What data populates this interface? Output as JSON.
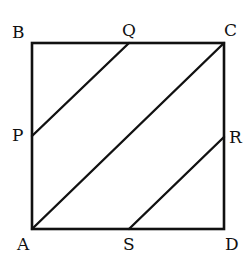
{
  "figure": {
    "points": {
      "A": "A",
      "B": "B",
      "C": "C",
      "D": "D",
      "P": "P",
      "Q": "Q",
      "R": "R",
      "S": "S"
    },
    "segments": [
      "AB",
      "BC",
      "CD",
      "DA",
      "AC",
      "PQ",
      "SR"
    ],
    "colors": {
      "stroke": "#111111",
      "background": "#ffffff"
    }
  }
}
